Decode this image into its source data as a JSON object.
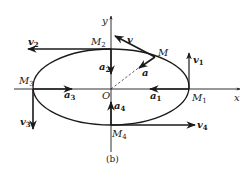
{
  "figure": {
    "caption": "(b)",
    "axes": {
      "x_label": "x",
      "y_label": "y",
      "origin_label": "O"
    },
    "points": [
      {
        "name": "M",
        "sub": ""
      },
      {
        "name": "M",
        "sub": "1"
      },
      {
        "name": "M",
        "sub": "2"
      },
      {
        "name": "M",
        "sub": "3"
      },
      {
        "name": "M",
        "sub": "4"
      }
    ],
    "velocity_vectors": [
      {
        "name": "v",
        "sub": ""
      },
      {
        "name": "v",
        "sub": "1"
      },
      {
        "name": "v",
        "sub": "2"
      },
      {
        "name": "v",
        "sub": "3"
      },
      {
        "name": "v",
        "sub": "4"
      }
    ],
    "acceleration_vectors": [
      {
        "name": "a",
        "sub": ""
      },
      {
        "name": "a",
        "sub": "1"
      },
      {
        "name": "a",
        "sub": "2"
      },
      {
        "name": "a",
        "sub": "3"
      },
      {
        "name": "a",
        "sub": "4"
      }
    ],
    "colors": {
      "ink": "#1a1a1a",
      "background": "#ffffff"
    }
  }
}
